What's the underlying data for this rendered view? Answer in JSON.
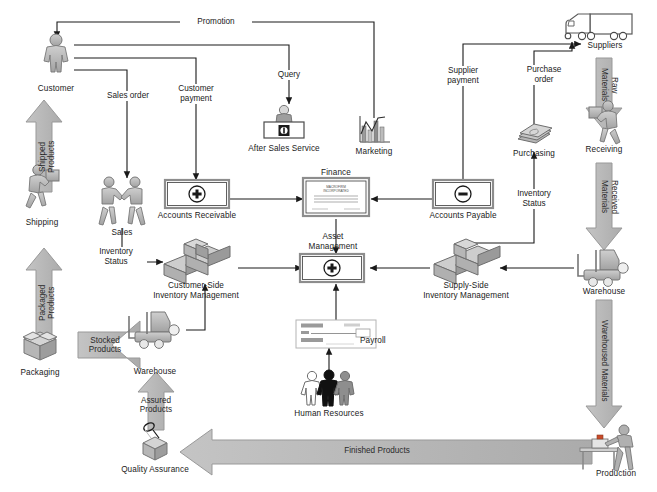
{
  "diagram": {
    "background": "#ffffff",
    "line_color": "#1a1a1a",
    "band_fill": "#b8b8b8",
    "band_stroke": "#9a9a9a",
    "icon_fill": "#b0b0b0",
    "icon_stroke": "#6e6e6e"
  },
  "nodes": [
    {
      "id": "customer",
      "label": "Customer",
      "icon": "person-icon",
      "x": 56,
      "y": 60
    },
    {
      "id": "shipping",
      "label": "Shipping",
      "icon": "person-carrying-box-icon",
      "x": 42,
      "y": 195
    },
    {
      "id": "packaging",
      "label": "Packaging",
      "icon": "open-box-icon",
      "x": 40,
      "y": 350
    },
    {
      "id": "quality",
      "label": "Quality Assurance",
      "icon": "magnifier-box-icon",
      "x": 155,
      "y": 448
    },
    {
      "id": "warehouse_left",
      "label": "Warehouse",
      "icon": "forklift-icon",
      "x": 155,
      "y": 347
    },
    {
      "id": "cust_inv",
      "label": "Customer-Side\nInventory Management",
      "icon": "stacked-boxes-icon",
      "x": 196,
      "y": 262
    },
    {
      "id": "sales",
      "label": "Sales",
      "icon": "handshake-people-icon",
      "x": 122,
      "y": 197
    },
    {
      "id": "ar",
      "label": "Accounts Receivable",
      "icon": "plus-ledger-icon",
      "x": 197,
      "y": 196
    },
    {
      "id": "ass",
      "label": "After Sales Service",
      "icon": "service-desk-icon",
      "x": 284,
      "y": 128
    },
    {
      "id": "marketing",
      "label": "Marketing",
      "icon": "bar-chart-icon",
      "x": 374,
      "y": 133
    },
    {
      "id": "finance",
      "label": "Finance",
      "icon": "certificate-icon",
      "x": 336,
      "y": 195,
      "doc_text": "MACROFIRM\nINCORPORATED"
    },
    {
      "id": "asset",
      "label": "Asset\nManagement",
      "icon": "plus-ledger-icon",
      "x": 332,
      "y": 268
    },
    {
      "id": "payroll",
      "label": "Payroll",
      "icon": "cheque-icon",
      "x": 312,
      "y": 333
    },
    {
      "id": "hr",
      "label": "Human Resources",
      "icon": "three-people-icon",
      "x": 329,
      "y": 390
    },
    {
      "id": "ap",
      "label": "Accounts Payable",
      "icon": "minus-ledger-icon",
      "x": 463,
      "y": 196
    },
    {
      "id": "purchasing",
      "label": "Purchasing",
      "icon": "banknotes-icon",
      "x": 534,
      "y": 137
    },
    {
      "id": "suppliers",
      "label": "Suppliers",
      "icon": "truck-icon",
      "x": 604,
      "y": 30
    },
    {
      "id": "receiving",
      "label": "Receiving",
      "icon": "person-carrying-box-icon",
      "x": 604,
      "y": 132
    },
    {
      "id": "supply_inv",
      "label": "Supply-Side\nInventory Management",
      "icon": "stacked-boxes-icon",
      "x": 466,
      "y": 262
    },
    {
      "id": "warehouse_right",
      "label": "Warehouse",
      "icon": "forklift-icon",
      "x": 604,
      "y": 271
    },
    {
      "id": "production",
      "label": "Production",
      "icon": "worker-bench-icon",
      "x": 614,
      "y": 450
    }
  ],
  "flow_labels": [
    {
      "id": "promotion",
      "label": "Promotion",
      "x": 215,
      "y": 26
    },
    {
      "id": "sales_order",
      "label": "Sales order",
      "x": 127,
      "y": 96
    },
    {
      "id": "customer_payment",
      "label": "Customer\npayment",
      "x": 196,
      "y": 89
    },
    {
      "id": "query",
      "label": "Query",
      "x": 289,
      "y": 76
    },
    {
      "id": "supplier_payment",
      "label": "Supplier\npayment",
      "x": 463,
      "y": 71
    },
    {
      "id": "purchase_order",
      "label": "Purchase\norder",
      "x": 544,
      "y": 70
    },
    {
      "id": "inventory_status_right",
      "label": "Inventory\nStatus",
      "x": 534,
      "y": 194
    },
    {
      "id": "inventory_status_left",
      "label": "Inventory\nStatus",
      "x": 116,
      "y": 252
    }
  ],
  "bands": [
    {
      "id": "shipped_products",
      "label": "Shipped Products",
      "direction": "up",
      "x": 44,
      "y": 158
    },
    {
      "id": "packaged_products",
      "label": "Packaged Products",
      "direction": "up",
      "x": 44,
      "y": 300
    },
    {
      "id": "stocked_products",
      "label": "Stocked\nProducts",
      "direction": "left",
      "x": 104,
      "y": 345
    },
    {
      "id": "assured_products",
      "label": "Assured\nProducts",
      "direction": "up",
      "x": 155,
      "y": 400
    },
    {
      "id": "finished_products",
      "label": "Finished Products",
      "direction": "left",
      "x": 375,
      "y": 450
    },
    {
      "id": "raw_materials",
      "label": "Raw Materials",
      "direction": "down",
      "x": 604,
      "y": 90
    },
    {
      "id": "received_materials",
      "label": "Received Materials",
      "direction": "down",
      "x": 604,
      "y": 207
    },
    {
      "id": "warehoused_materials",
      "label": "Warehoused Materials",
      "direction": "down",
      "x": 604,
      "y": 370
    }
  ]
}
